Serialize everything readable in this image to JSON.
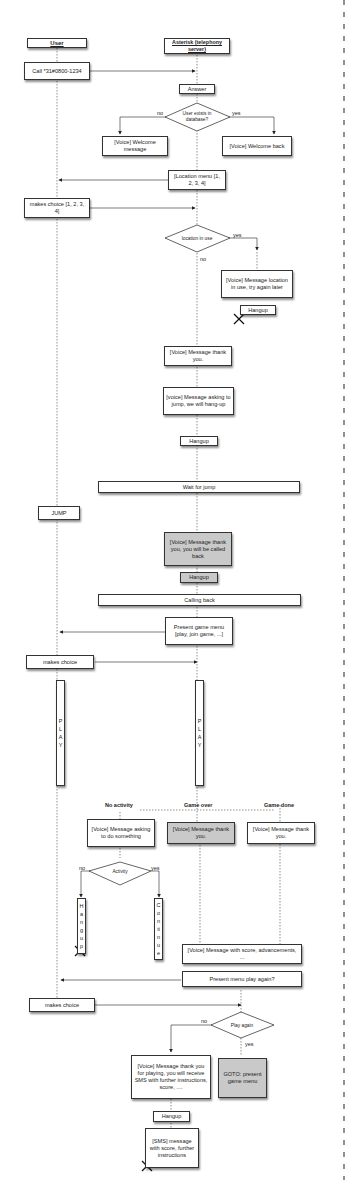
{
  "lifelines": {
    "user": "User",
    "asterisk": "Asterisk (telephony server)"
  },
  "steps": {
    "call": "Call *31#0800-1234",
    "answer": "Answer",
    "user_exists_decision": "User exists in database?",
    "welcome_no_label": "no",
    "welcome_yes_label": "yes",
    "welcome_message": "[Voice] Welcome message",
    "welcome_back": "[Voice] Welcome back",
    "location_menu": "[Location menu [1, 2, 3, 4]",
    "makes_choice_location": "makes choice [1, 2, 3, 4]",
    "location_in_use_decision": "location in use",
    "location_yes_label": "yes",
    "location_no_label": "no",
    "location_in_use_message": "[Voice] Message location in use, try again later",
    "hangup_1": "Hangup",
    "thank_you_1": "[Voice] Message thank you.",
    "ask_jump": "[voice] Message asking to jump, we will hang-up",
    "hangup_2": "Hangup",
    "wait_for_jump": "Wait for jump",
    "jump": "JUMP",
    "called_back_message": "[Voice] Message thank you, you will be called back",
    "hangup_3": "Hangup",
    "calling_back": "Calling back",
    "present_game_menu": "Present game menu [play, join game, ...]",
    "makes_choice_game": "makes choice",
    "play_user": "PLAY",
    "play_server": "PLAY",
    "no_activity": "No activity",
    "game_over": "Game over",
    "game_done": "Game done",
    "ask_do_something": "[Voice] Message asking to do something",
    "thank_you_game_over": "[Voice] Message thank you.",
    "thank_you_game_done": "[Voice] Message thank you.",
    "activity_decision": "Activity",
    "activity_no_label": "no",
    "activity_yes_label": "yes",
    "hangup_vertical": "Hangup",
    "continue_vertical": "Continue",
    "score_message": "[Voice] Message with score, advancements, ...",
    "present_play_again": "Present menu play again?",
    "makes_choice_again": "makes choice",
    "play_again_decision": "Play again",
    "play_again_no_label": "no",
    "play_again_yes_label": "yes",
    "thank_you_sms": "[Voice] Message thank you for playing, you will receive SMS with further instructions, score, ....",
    "goto_menu": "GOTO: present game menu",
    "hangup_4": "Hangup",
    "sms_message": "[SMS] message with score, further instructions"
  }
}
